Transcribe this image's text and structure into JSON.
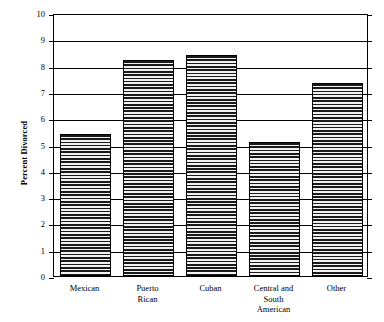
{
  "chart_data": {
    "type": "bar",
    "title": "",
    "xlabel": "",
    "ylabel": "Percent Divorced",
    "categories": [
      "Mexican",
      "Puerto Rican",
      "Cuban",
      "Central and South American",
      "Other"
    ],
    "category_lines": [
      [
        "Mexican"
      ],
      [
        "Puerto",
        "Rican"
      ],
      [
        "Cuban"
      ],
      [
        "Central and",
        "South",
        "American"
      ],
      [
        "Other"
      ]
    ],
    "values": [
      5.4,
      8.2,
      8.4,
      5.1,
      7.35
    ],
    "ylim": [
      0,
      10
    ],
    "yticks": [
      0,
      1,
      2,
      3,
      4,
      5,
      6,
      7,
      8,
      9,
      10
    ],
    "ytick_labels": [
      "0",
      "1",
      "2",
      "3",
      "4",
      "5",
      "6",
      "7",
      "8",
      "9",
      "10"
    ],
    "grid": true,
    "grid_axis": "y",
    "legend": "none",
    "bar_fill": "horizontal-line-hatch",
    "bar_fill_color": "#1a1a1a",
    "bar_edge_color": "#000000",
    "axis_color": "#000000",
    "background_color": "#ffffff"
  }
}
